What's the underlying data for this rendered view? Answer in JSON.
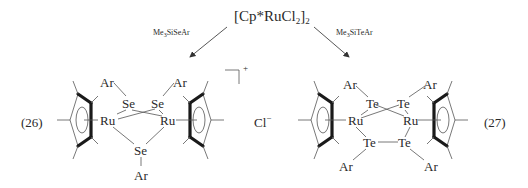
{
  "diagram": {
    "starting_material": {
      "prefix": "[Cp*RuCl",
      "sub1": "2",
      "bracket": "]",
      "sub2": "2"
    },
    "reagents": {
      "left": {
        "pre": "Me",
        "sub": "3",
        "post": "SiSeAr"
      },
      "right": {
        "pre": "Me",
        "sub": "3",
        "post": "SiTeAr"
      }
    },
    "compound_26": {
      "number": "(26)",
      "metal": "Ru",
      "chalcogen": "Se",
      "substituent": "Ar",
      "charge": "+",
      "counterion": "Cl",
      "counterion_charge": "−"
    },
    "compound_27": {
      "number": "(27)",
      "metal": "Ru",
      "chalcogen": "Te",
      "substituent": "Ar"
    }
  }
}
